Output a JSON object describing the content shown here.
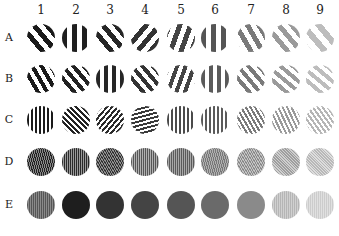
{
  "figure": {
    "column_labels": [
      "1",
      "2",
      "3",
      "4",
      "5",
      "6",
      "7",
      "8",
      "9"
    ],
    "row_labels": [
      "A",
      "B",
      "C",
      "D",
      "E"
    ],
    "layout": {
      "col_x": [
        41,
        76,
        110,
        145,
        181,
        215,
        251,
        286,
        320
      ],
      "row_y": [
        38,
        79,
        120,
        162,
        205
      ],
      "col_label_y": 3,
      "disc_diameter": 28
    },
    "rows": [
      {
        "label": "A",
        "discs": [
          {
            "col": "1",
            "angle": -40,
            "stripe": 5,
            "fg": "#1a1a1a",
            "bg": "#ffffff"
          },
          {
            "col": "2",
            "angle": 0,
            "stripe": 5,
            "fg": "#1f1f1f",
            "bg": "#ffffff"
          },
          {
            "col": "3",
            "angle": -40,
            "stripe": 5,
            "fg": "#262626",
            "bg": "#ffffff"
          },
          {
            "col": "4",
            "angle": 40,
            "stripe": 5,
            "fg": "#333333",
            "bg": "#ffffff"
          },
          {
            "col": "5",
            "angle": 20,
            "stripe": 5,
            "fg": "#444444",
            "bg": "#ffffff"
          },
          {
            "col": "6",
            "angle": 0,
            "stripe": 5,
            "fg": "#555555",
            "bg": "#ffffff"
          },
          {
            "col": "7",
            "angle": -30,
            "stripe": 5,
            "fg": "#7a7a7a",
            "bg": "#ffffff"
          },
          {
            "col": "8",
            "angle": -40,
            "stripe": 5,
            "fg": "#9a9a9a",
            "bg": "#ffffff"
          },
          {
            "col": "9",
            "angle": -40,
            "stripe": 6,
            "fg": "#bdbdbd",
            "bg": "#ffffff"
          }
        ]
      },
      {
        "label": "B",
        "discs": [
          {
            "col": "1",
            "angle": -30,
            "stripe": 4,
            "fg": "#1a1a1a",
            "bg": "#ffffff"
          },
          {
            "col": "2",
            "angle": -40,
            "stripe": 4,
            "fg": "#222222",
            "bg": "#ffffff"
          },
          {
            "col": "3",
            "angle": 0,
            "stripe": 4,
            "fg": "#262626",
            "bg": "#ffffff"
          },
          {
            "col": "4",
            "angle": -40,
            "stripe": 4,
            "fg": "#333333",
            "bg": "#ffffff"
          },
          {
            "col": "5",
            "angle": 20,
            "stripe": 4,
            "fg": "#444444",
            "bg": "#ffffff"
          },
          {
            "col": "6",
            "angle": 0,
            "stripe": 4,
            "fg": "#5a5a5a",
            "bg": "#ffffff"
          },
          {
            "col": "7",
            "angle": -40,
            "stripe": 4,
            "fg": "#7a7a7a",
            "bg": "#ffffff"
          },
          {
            "col": "8",
            "angle": -50,
            "stripe": 4,
            "fg": "#9a9a9a",
            "bg": "#ffffff"
          },
          {
            "col": "9",
            "angle": -50,
            "stripe": 4,
            "fg": "#bdbdbd",
            "bg": "#ffffff"
          }
        ]
      },
      {
        "label": "C",
        "discs": [
          {
            "col": "1",
            "angle": 0,
            "stripe": 2,
            "fg": "#1a1a1a",
            "bg": "#ffffff"
          },
          {
            "col": "2",
            "angle": -45,
            "stripe": 2,
            "fg": "#222222",
            "bg": "#ffffff"
          },
          {
            "col": "3",
            "angle": 40,
            "stripe": 2,
            "fg": "#2a2a2a",
            "bg": "#ffffff"
          },
          {
            "col": "4",
            "angle": 75,
            "stripe": 2,
            "fg": "#3a3a3a",
            "bg": "#ffffff"
          },
          {
            "col": "5",
            "angle": 0,
            "stripe": 2,
            "fg": "#4a4a4a",
            "bg": "#ffffff"
          },
          {
            "col": "6",
            "angle": 0,
            "stripe": 2,
            "fg": "#5a5a5a",
            "bg": "#ffffff"
          },
          {
            "col": "7",
            "angle": -30,
            "stripe": 2,
            "fg": "#7a7a7a",
            "bg": "#ffffff"
          },
          {
            "col": "8",
            "angle": -25,
            "stripe": 2,
            "fg": "#9a9a9a",
            "bg": "#ffffff"
          },
          {
            "col": "9",
            "angle": -35,
            "stripe": 2,
            "fg": "#b5b5b5",
            "bg": "#ffffff"
          }
        ]
      },
      {
        "label": "D",
        "discs": [
          {
            "col": "1",
            "angle": -15,
            "stripe": 1,
            "fg": "#222222",
            "bg": "#8a8a8a"
          },
          {
            "col": "2",
            "angle": 0,
            "stripe": 1,
            "fg": "#2a2a2a",
            "bg": "#9a9a9a"
          },
          {
            "col": "3",
            "angle": -30,
            "stripe": 1,
            "fg": "#333333",
            "bg": "#909090"
          },
          {
            "col": "4",
            "angle": 0,
            "stripe": 1,
            "fg": "#555555",
            "bg": "#b0b0b0"
          },
          {
            "col": "5",
            "angle": 0,
            "stripe": 1,
            "fg": "#5a5a5a",
            "bg": "#a8a8a8"
          },
          {
            "col": "6",
            "angle": -15,
            "stripe": 1,
            "fg": "#777777",
            "bg": "#b0b0b0"
          },
          {
            "col": "7",
            "angle": -30,
            "stripe": 1,
            "fg": "#8a8a8a",
            "bg": "#c4c4c4"
          },
          {
            "col": "8",
            "angle": -45,
            "stripe": 1,
            "fg": "#9e9e9e",
            "bg": "#cfcfcf"
          },
          {
            "col": "9",
            "angle": -45,
            "stripe": 1,
            "fg": "#b8b8b8",
            "bg": "#dddddd"
          }
        ]
      },
      {
        "label": "E",
        "discs": [
          {
            "col": "1",
            "angle": 0,
            "stripe": 1,
            "fg": "#555555",
            "bg": "#8a8a8a"
          },
          {
            "col": "2",
            "angle": 0,
            "stripe": 0,
            "fg": "#1e1e1e",
            "bg": "#1e1e1e"
          },
          {
            "col": "3",
            "angle": 0,
            "stripe": 0,
            "fg": "#333333",
            "bg": "#333333"
          },
          {
            "col": "4",
            "angle": 0,
            "stripe": 0,
            "fg": "#444444",
            "bg": "#444444"
          },
          {
            "col": "5",
            "angle": 0,
            "stripe": 0,
            "fg": "#555555",
            "bg": "#555555"
          },
          {
            "col": "6",
            "angle": 0,
            "stripe": 0,
            "fg": "#6a6a6a",
            "bg": "#6a6a6a"
          },
          {
            "col": "7",
            "angle": 0,
            "stripe": 0,
            "fg": "#8a8a8a",
            "bg": "#8a8a8a"
          },
          {
            "col": "8",
            "angle": 0,
            "stripe": 1,
            "fg": "#b5b5b5",
            "bg": "#d0d0d0"
          },
          {
            "col": "9",
            "angle": 0,
            "stripe": 1,
            "fg": "#cccccc",
            "bg": "#e0e0e0"
          }
        ]
      }
    ]
  }
}
